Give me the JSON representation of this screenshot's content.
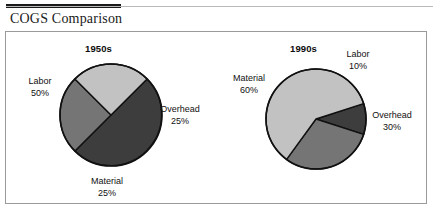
{
  "document": {
    "title": "COGS Comparison"
  },
  "chart_data": [
    {
      "type": "pie",
      "title": "1950s",
      "categories": [
        "Labor",
        "Overhead",
        "Material"
      ],
      "values": [
        50,
        25,
        25
      ],
      "value_labels": [
        "50%",
        "25%",
        "25%"
      ],
      "colors": [
        "#3d3d3d",
        "#757575",
        "#c2c2c2"
      ],
      "start_angle_deg": -45,
      "direction": "clockwise",
      "center": {
        "x": 111,
        "y": 115
      },
      "radius": 51,
      "labels": [
        {
          "name": "Labor",
          "pct": "50%",
          "x": 16,
          "y": 76,
          "width": 48
        },
        {
          "name": "Overhead",
          "pct": "25%",
          "x": 152,
          "y": 104,
          "width": 56
        },
        {
          "name": "Material",
          "pct": "25%",
          "x": 80,
          "y": 176,
          "width": 54
        }
      ]
    },
    {
      "type": "pie",
      "title": "1990s",
      "categories": [
        "Labor",
        "Overhead",
        "Material"
      ],
      "values": [
        10,
        30,
        60
      ],
      "value_labels": [
        "10%",
        "30%",
        "60%"
      ],
      "colors": [
        "#3d3d3d",
        "#757575",
        "#c2c2c2"
      ],
      "start_angle_deg": -18,
      "direction": "clockwise",
      "center": {
        "x": 316,
        "y": 119
      },
      "radius": 50,
      "labels": [
        {
          "name": "Labor",
          "pct": "10%",
          "x": 337,
          "y": 49,
          "width": 42
        },
        {
          "name": "Overhead",
          "pct": "30%",
          "x": 364,
          "y": 110,
          "width": 56
        },
        {
          "name": "Material",
          "pct": "60%",
          "x": 224,
          "y": 73,
          "width": 50
        }
      ]
    }
  ],
  "pie_titles": [
    {
      "label": "1950s",
      "x": 85,
      "y": 43
    },
    {
      "label": "1990s",
      "x": 290,
      "y": 43
    }
  ],
  "colors": {
    "slice_dark": "#3d3d3d",
    "slice_medium": "#757575",
    "slice_light": "#c2c2c2",
    "outline": "#111111",
    "panel_border": "#9a9a9a",
    "rule_dark": "#1b1b1b",
    "rule_light": "#b9b9b9",
    "text": "#111111",
    "background": "#ffffff"
  }
}
